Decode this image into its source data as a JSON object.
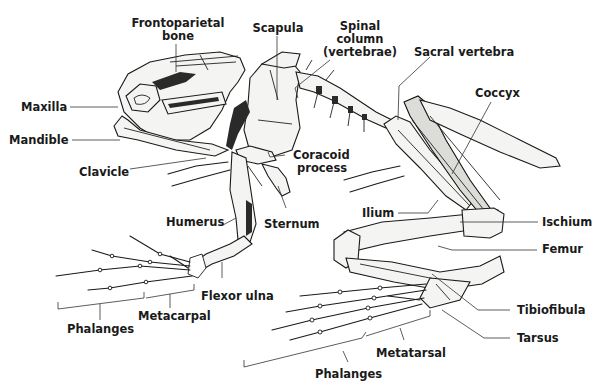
{
  "diagram": {
    "labels": {
      "frontoparietal_1": "Frontoparietal",
      "frontoparietal_2": "bone",
      "scapula": "Scapula",
      "spinal_1": "Spinal",
      "spinal_2": "column",
      "spinal_3": "(vertebrae)",
      "sacral": "Sacral vertebra",
      "coccyx": "Coccyx",
      "maxilla": "Maxilla",
      "mandible": "Mandible",
      "clavicle": "Clavicle",
      "coracoid_1": "Coracoid",
      "coracoid_2": "process",
      "humerus": "Humerus",
      "sternum": "Sternum",
      "ilium": "Ilium",
      "ischium": "Ischium",
      "femur": "Femur",
      "flexor_ulna": "Flexor ulna",
      "metacarpal": "Metacarpal",
      "phalanges_fore": "Phalanges",
      "tibiofibula": "Tibiofibula",
      "tarsus": "Tarsus",
      "metatarsal": "Metatarsal",
      "phalanges_hind": "Phalanges"
    }
  }
}
